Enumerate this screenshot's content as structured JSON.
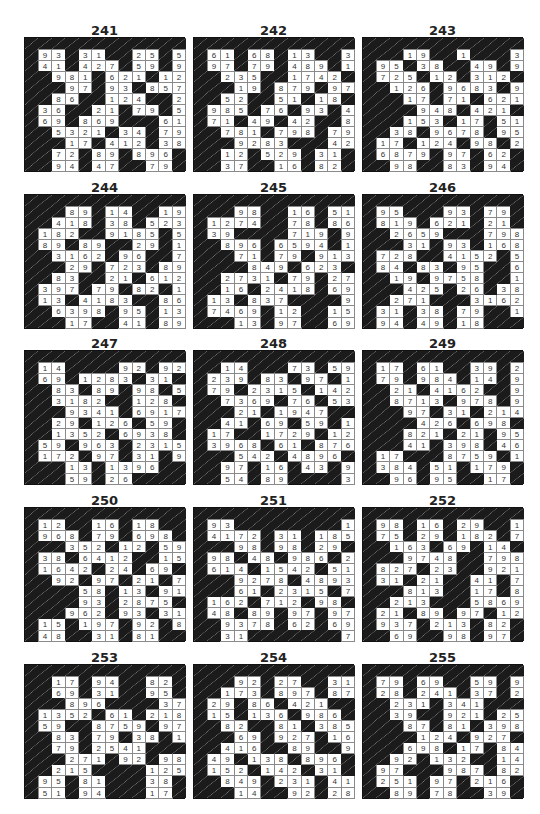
{
  "page": {
    "type": "kakuro-solutions",
    "cols": 12,
    "rows": 12
  },
  "puzzles": [
    {
      "id": "241",
      "x": 24,
      "y": 37,
      "rows": [
        "############",
        "#93#31##25#59",
        "#41#427#59#97",
        "##981#621#12",
        "###97#93#8579",
        "##86##124##23",
        "#36##21#79#51",
        "#69#869###61",
        "##5321#34#79",
        "###17#412#381",
        "##72#89#896#69",
        "##94#47##79#21"
      ]
    },
    {
      "id": "242",
      "x": 193,
      "y": 37,
      "rows": [
        "############",
        "#61#68#13##31",
        "#97#79#489#12",
        "##235##1742",
        "###19#879#975",
        "##52##51#18#39",
        "#985#76#93#413",
        "#71#49#42##82",
        "##781#798#79",
        "###9283###428",
        "##12#529#31#12",
        "##37##16#82#79"
      ]
    },
    {
      "id": "243",
      "x": 362,
      "y": 37,
      "rows": [
        "############",
        "###19##1###3",
        "#95#38##49#9128",
        "#725#12#312#17",
        "##126#9683#95",
        "###17#71#621",
        "####948#421",
        "###153#17#51",
        "##38#9678#958",
        "#17#124#98#241",
        "#6879#97#62#97",
        "##98##83#94"
      ]
    },
    {
      "id": "244",
      "x": 24,
      "y": 194,
      "rows": [
        "############",
        "###89#14##19",
        "##418#38#5231",
        "#182##9185#59",
        "#89#89##29#128",
        "##3162#96##76",
        "###29#723#89",
        "##83##21#6124",
        "#397#79#82#15",
        "#13#4183##869",
        "##6398#95#132",
        "###17##41#89"
      ]
    },
    {
      "id": "245",
      "x": 193,
      "y": 194,
      "rows": [
        "############",
        "###98##16#51",
        "#1274##78#8671",
        "#39####719#95",
        "##896#6594#14",
        "###71#79#9138",
        "####849#623",
        "##2731#79#27",
        "##16#2418#698",
        "#13#837####98",
        "#7469#12##1523",
        "###13#97##69"
      ]
    },
    {
      "id": "246",
      "x": 362,
      "y": 194,
      "rows": [
        "############",
        "#95###93#79#21",
        "#819#621#21#92",
        "##2659###798",
        "###31#93#168",
        "#728##4152#51",
        "#84#83#95##69",
        "##19#9758##123",
        "###425#26#38",
        "##271###3162",
        "#31#38#79##147",
        "#94#49#18###14"
      ]
    },
    {
      "id": "247",
      "x": 24,
      "y": 350,
      "rows": [
        "############",
        "#14####92#92",
        "#69#1283#31",
        "##83#89#98#589",
        "##3182##128#53",
        "###9341#6917",
        "##29#126#59",
        "##1352#6938",
        "#59#963#2315",
        "#172#97#31#96",
        "###13#1396##97",
        "###59#26####86"
      ]
    },
    {
      "id": "248",
      "x": 193,
      "y": 350,
      "rows": [
        "############",
        "##14###73#59",
        "#239#83#97#17",
        "#79#2315#142",
        "##7369#76#5369",
        "###21#1947##13",
        "##41#69#59#14",
        "#17##1729#12",
        "#3968#61#8769",
        "###542#4896#61",
        "##97#16#43#987",
        "##54#89####37"
      ]
    },
    {
      "id": "249",
      "x": 362,
      "y": 350,
      "rows": [
        "############",
        "#17#61##39#21",
        "#79#984#14#931",
        "##21#4162##92",
        "##8713#978#96",
        "###97#31#214",
        "####426#698",
        "###821#21#95",
        "###41#398#4623",
        "#17###8759#18",
        "#384#51#179#79",
        "##96#95##17#15"
      ]
    },
    {
      "id": "250",
      "x": 24,
      "y": 507,
      "rows": [
        "############",
        "#12##16#18##31",
        "#968#79#698#94",
        "###352#12#598",
        "#38#6412##15",
        "#1642#24#69",
        "##92#97#21#79",
        "####58#13#9137",
        "####93#2875#89",
        "###962#93#319",
        "#15#197#92#821",
        "#48##31#81##97"
      ]
    },
    {
      "id": "251",
      "x": 193,
      "y": 507,
      "rows": [
        "############",
        "#93########13",
        "#4172#31#1859",
        "###98#98#29#13",
        "#98#48#986#241",
        "#614#1542#51",
        "###9278#4893",
        "###61#2315#739",
        "#162#712#98#16",
        "#48#89#97#97",
        "##9378#62#6985",
        "##31#######79"
      ]
    },
    {
      "id": "252",
      "x": 362,
      "y": 507,
      "rows": [
        "############",
        "#98#16#29##17",
        "#75#29#182#796",
        "##163#69#14#31",
        "###9748##798",
        "#827#23##921",
        "#31#21##41#71",
        "###813##17#896",
        "##213###5869",
        "#21#89#97#126",
        "#937#213#82#81",
        "##69##98#97#92"
      ]
    },
    {
      "id": "253",
      "x": 24,
      "y": 664,
      "rows": [
        "############",
        "##17#94##82#24",
        "##69#31##95#39",
        "###896####371",
        "#1352#61#218",
        "#59##8759#97",
        "##83#79#38#14",
        "##79#2541###13",
        "###271#92#9821",
        "##215####125",
        "#95#81###38#71",
        "#51#94###17#98"
      ]
    },
    {
      "id": "254",
      "x": 193,
      "y": 664,
      "rows": [
        "############",
        "###92#27##31",
        "##173#897#874",
        "#29#86#421##214",
        "#15#136#986#69",
        "##82##81#385",
        "###69#927#16",
        "##416##89##98",
        "#49#138#896#39",
        "#152#142#31#18",
        "##849#231#412",
        "###14##92#28"
      ]
    },
    {
      "id": "255",
      "x": 362,
      "y": 664,
      "rows": [
        "############",
        "#79#69##59#98",
        "#28#241#37#213",
        "##231#341###69",
        "##39##921#25",
        "###87#81#398",
        "####124#927",
        "###698#17#84",
        "##92#132##14",
        "#97###987#821",
        "#251#97#216#26",
        "##89#78##39#79"
      ]
    }
  ]
}
